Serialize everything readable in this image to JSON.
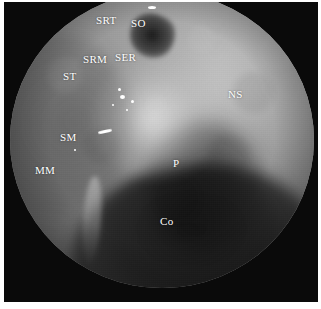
{
  "figure": {
    "kind": "endoscopic-photograph",
    "modality": "nasal endoscopy",
    "view_shape": "circular field of view",
    "color_mode": "grayscale",
    "background_color": "#0a0a0a",
    "page_color": "#ffffff",
    "label_color": "#ffffff",
    "width_px": 321,
    "height_px": 309
  },
  "annotations": [
    {
      "id": "srt",
      "text": "SRT",
      "x": 96,
      "y": 15
    },
    {
      "id": "so",
      "text": "SO",
      "x": 131,
      "y": 18
    },
    {
      "id": "srm",
      "text": "SRM",
      "x": 83,
      "y": 54
    },
    {
      "id": "ser",
      "text": "SER",
      "x": 115,
      "y": 52
    },
    {
      "id": "st",
      "text": "ST",
      "x": 63,
      "y": 71
    },
    {
      "id": "ns",
      "text": "NS",
      "x": 228,
      "y": 89
    },
    {
      "id": "sm",
      "text": "SM",
      "x": 60,
      "y": 132
    },
    {
      "id": "mm",
      "text": "MM",
      "x": 35,
      "y": 165
    },
    {
      "id": "p",
      "text": "P",
      "x": 173,
      "y": 158
    },
    {
      "id": "co",
      "text": "Co",
      "x": 160,
      "y": 216
    }
  ],
  "speculars": [
    {
      "id": "glare-main",
      "x": 120,
      "y": 95,
      "w": 5,
      "h": 4
    },
    {
      "id": "glare-upper",
      "x": 118,
      "y": 88,
      "w": 3,
      "h": 3
    },
    {
      "id": "glare-right",
      "x": 131,
      "y": 100,
      "w": 3,
      "h": 3
    },
    {
      "id": "glare-small1",
      "x": 112,
      "y": 104,
      "w": 2,
      "h": 2
    },
    {
      "id": "glare-small2",
      "x": 126,
      "y": 109,
      "w": 2,
      "h": 2
    },
    {
      "id": "glare-streak",
      "x": 98,
      "y": 130,
      "w": 14,
      "h": 3
    },
    {
      "id": "glare-dot",
      "x": 74,
      "y": 149,
      "w": 2,
      "h": 2
    },
    {
      "id": "glare-top",
      "x": 148,
      "y": 6,
      "w": 8,
      "h": 3
    }
  ]
}
